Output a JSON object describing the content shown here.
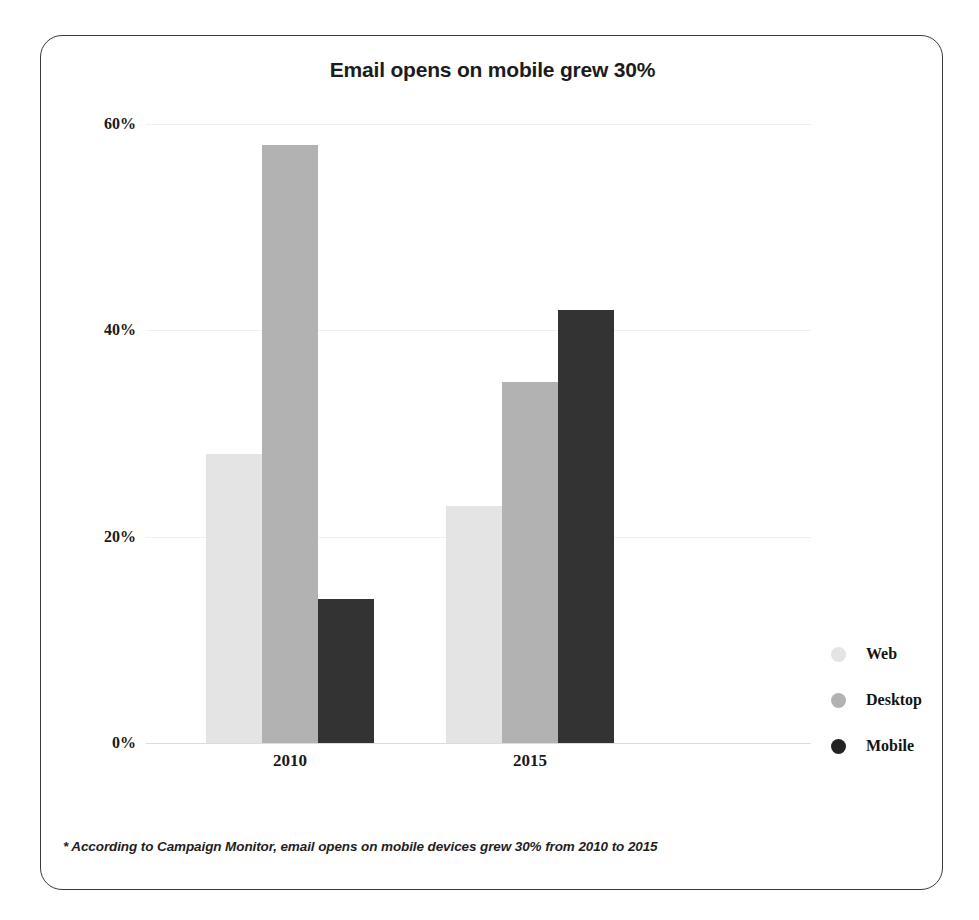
{
  "card": {
    "border_color": "#3a3a3a",
    "background": "#ffffff"
  },
  "footnote": {
    "text": "* According to Campaign Monitor, email opens on mobile devices grew 30% from 2010 to 2015"
  },
  "legend": {
    "position": "right",
    "items": [
      {
        "label": "Web",
        "color": "#e4e4e4",
        "marker": "circle-dot-icon"
      },
      {
        "label": "Desktop",
        "color": "#b2b2b2",
        "marker": "circle-dot-icon"
      },
      {
        "label": "Mobile",
        "color": "#232323",
        "marker": "circle-dot-icon"
      }
    ]
  },
  "chart_data": {
    "type": "bar",
    "title": "Email opens on mobile grew 30%",
    "xlabel": "",
    "ylabel": "",
    "categories": [
      "2010",
      "2015"
    ],
    "series": [
      {
        "name": "Web",
        "color": "#e4e4e4",
        "values": [
          28,
          23
        ]
      },
      {
        "name": "Desktop",
        "color": "#b2b2b2",
        "values": [
          58,
          35
        ]
      },
      {
        "name": "Mobile",
        "color": "#333333",
        "values": [
          14,
          42
        ]
      }
    ],
    "ylim": [
      0,
      60
    ],
    "yticks": [
      0,
      20,
      40,
      60
    ],
    "ytick_labels": [
      "0%",
      "20%",
      "40%",
      "60%"
    ],
    "grid": true,
    "legend_position": "right",
    "value_format": "percent"
  }
}
